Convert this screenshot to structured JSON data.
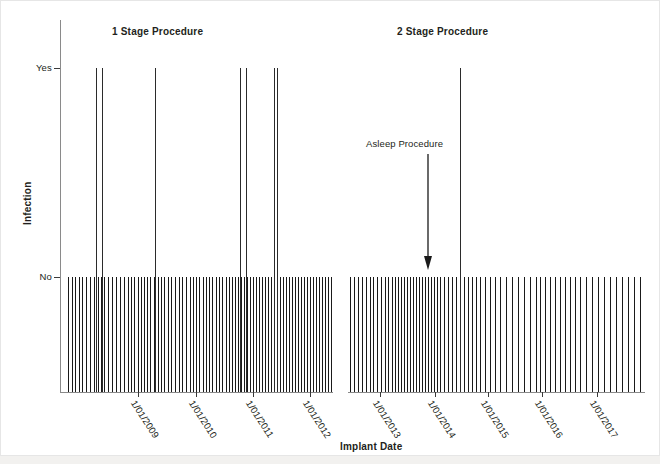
{
  "chart_data": {
    "type": "scatter",
    "title": "",
    "xlabel": "Implant Date",
    "ylabel": "Infection",
    "y_categories": [
      "No",
      "Yes"
    ],
    "y_tick_labels": [
      "Yes",
      "No"
    ],
    "x_tick_labels": [
      "1/01/2009",
      "1/01/2010",
      "1/01/2011",
      "1/01/2012",
      "1/01/2013",
      "1/01/2014",
      "1/01/2015",
      "1/01/2016",
      "1/01/2017"
    ],
    "x_tick_rotation_deg": 57,
    "grid": false,
    "legend": null,
    "axis_break": true,
    "panels": [
      {
        "name": "panel-1-stage",
        "title": "1 Stage Procedure",
        "x_range_start_frac": 0.0,
        "x_range_end_frac": 0.463,
        "infection_yes_positions_px": [
          96,
          102,
          155,
          240,
          246,
          274,
          277
        ],
        "infection_no_positions_px": [
          68,
          72,
          75,
          79,
          82,
          86,
          90,
          94,
          98,
          101,
          104,
          108,
          112,
          116,
          120,
          124,
          128,
          131,
          134,
          138,
          141,
          144,
          147,
          150,
          154,
          158,
          161,
          164,
          168,
          171,
          175,
          179,
          182,
          186,
          190,
          193,
          196,
          199,
          203,
          206,
          209,
          212,
          216,
          219,
          222,
          226,
          229,
          232,
          235,
          238,
          241,
          244,
          247,
          250,
          253,
          256,
          259,
          262,
          265,
          268,
          271,
          274,
          277,
          280,
          283,
          286,
          289,
          292,
          295,
          298,
          301,
          304,
          307,
          310,
          313,
          316,
          319,
          322,
          325,
          328,
          331
        ]
      },
      {
        "name": "panel-2-stage",
        "title": "2 Stage Procedure",
        "x_range_start_frac": 0.488,
        "x_range_end_frac": 1.0,
        "infection_yes_positions_px": [
          460
        ],
        "infection_no_positions_px": [
          350,
          354,
          358,
          362,
          366,
          370,
          373,
          377,
          381,
          385,
          388,
          392,
          395,
          398,
          401,
          404,
          407,
          410,
          413,
          416,
          419,
          422,
          425,
          428,
          431,
          434,
          437,
          440,
          444,
          448,
          452,
          456,
          460,
          464,
          468,
          472,
          476,
          480,
          485,
          490,
          495,
          500,
          506,
          512,
          518,
          524,
          530,
          536,
          540,
          545,
          550,
          555,
          560,
          565,
          570,
          575,
          580,
          586,
          592,
          598,
          604,
          610,
          616,
          622,
          628,
          634,
          640
        ]
      }
    ],
    "annotation": {
      "label": "Asleep Procedure",
      "arrow_from_y_px": 158,
      "arrow_to_y_px": 268,
      "arrow_x_px": 427
    },
    "ylim_labels": {
      "top": "Yes",
      "bottom": "No"
    }
  },
  "axes": {
    "x_title": "Implant Date",
    "y_title": "Infection",
    "y_ticks": [
      {
        "label": "Yes",
        "top_px": 48
      },
      {
        "label": "No",
        "top_px": 257
      }
    ],
    "x_ticks": [
      {
        "label": "1/01/2009",
        "left_px": 78
      },
      {
        "label": "1/01/2010",
        "left_px": 136
      },
      {
        "label": "1/01/2011",
        "left_px": 193
      },
      {
        "label": "1/01/2012",
        "left_px": 250
      },
      {
        "label": "1/01/2013",
        "left_px": 320
      },
      {
        "label": "1/01/2014",
        "left_px": 375
      },
      {
        "label": "1/01/2015",
        "left_px": 428
      },
      {
        "label": "1/01/2016",
        "left_px": 482
      },
      {
        "label": "1/01/2017",
        "left_px": 537
      }
    ]
  },
  "panel_titles": [
    {
      "text": "1 Stage Procedure",
      "left_px": 112,
      "top_px": 26
    },
    {
      "text": "2 Stage Procedure",
      "left_px": 397,
      "top_px": 26
    }
  ],
  "annotation": {
    "label": "Asleep Procedure",
    "label_left_px": 366,
    "label_top_px": 138
  },
  "colors": {
    "background": "#ffffff",
    "spike": "#1a1a1a",
    "axis": "#8a8a8a",
    "text": "#231f20",
    "frame": "#e6e6e6",
    "bottom_strip": "#f2f1ef"
  }
}
